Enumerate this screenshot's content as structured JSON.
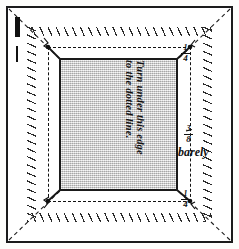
{
  "figure": {
    "instruction_line1": "Turn under this edge",
    "instruction_line2": "to the dotted line.",
    "measure_barely": "barely",
    "fractions": {
      "quarter_numerator": "1",
      "quarter_denominator": "4",
      "quarter_unit": "″",
      "three_eighths_numerator": "3",
      "three_eighths_denominator": "8",
      "three_eighths_unit": "″"
    },
    "colors": {
      "ink": "#1b1b1b",
      "panel_fill": "#d9d9d9",
      "paper": "#ffffff"
    },
    "icons": {
      "scale_thick": "thick-rule-mark",
      "scale_thin": "thin-rule-mark",
      "corner": "corner-tick-mark"
    }
  }
}
